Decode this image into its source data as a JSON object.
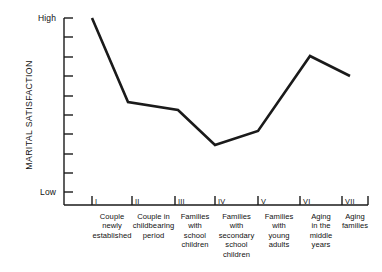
{
  "chart_data": {
    "type": "line",
    "title": "",
    "xlabel": "",
    "ylabel": "MARITAL SATISFACTION",
    "y_axis": {
      "high_label": "High",
      "low_label": "Low",
      "tick_count": 10,
      "numeric_ticks": false,
      "ylim": [
        0,
        10
      ]
    },
    "grid": false,
    "legend": null,
    "categories": [
      "Couple newly established",
      "Couple in childbearing period",
      "Families with school children",
      "Families with secondary school children",
      "Families with young adults",
      "Aging in the middle years",
      "Aging families"
    ],
    "category_lines": [
      [
        "Couple",
        "newly",
        "established"
      ],
      [
        "Couple in",
        "childbearing",
        "period"
      ],
      [
        "Families",
        "with",
        "school",
        "children"
      ],
      [
        "Families",
        "with",
        "secondary",
        "school",
        "children"
      ],
      [
        "Families",
        "with",
        "young",
        "adults"
      ],
      [
        "Aging",
        "in the",
        "middle",
        "years"
      ],
      [
        "Aging",
        "families"
      ]
    ],
    "stage_numerals": [
      "I",
      "II",
      "III",
      "IV",
      "V",
      "VI",
      "VII"
    ],
    "values": [
      9.6,
      5.7,
      5.3,
      2.8,
      3.6,
      8.1,
      7.0
    ],
    "series": [
      {
        "name": "Marital satisfaction",
        "values": [
          9.6,
          5.7,
          5.3,
          2.8,
          3.6,
          8.1,
          7.0
        ]
      }
    ],
    "points_px": [
      [
        92,
        18
      ],
      [
        128,
        102
      ],
      [
        178,
        110
      ],
      [
        215,
        145
      ],
      [
        258,
        131
      ],
      [
        310,
        56
      ],
      [
        350,
        76
      ]
    ],
    "line_color": "#1a1a1a",
    "line_width_px": 2.6,
    "background_color": "#ffffff"
  },
  "axes": {
    "axis_color": "#1a1a1a",
    "x_axis_y_px": 205,
    "y_axis_x_px": 64,
    "x_axis_end_px": 368,
    "y_axis_top_px": 18,
    "y_tick_length_px": 9,
    "x_tick_length_px": 9,
    "x_tick_positions_px": [
      92,
      132,
      175,
      215,
      258,
      300,
      342
    ],
    "y_tick_positions_px": [
      18,
      37,
      57,
      76,
      96,
      115,
      134,
      154,
      173,
      192
    ]
  }
}
